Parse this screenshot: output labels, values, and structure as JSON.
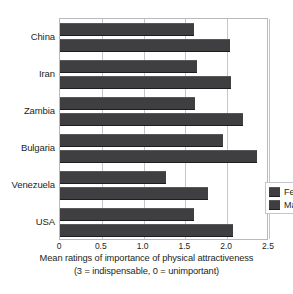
{
  "chart_data": {
    "type": "bar",
    "orientation": "horizontal",
    "title": "",
    "subtitle": "",
    "xlabel": "Mean ratings of importance of physical attractiveness",
    "xlabel_line2": "(3 = indispensable, 0 = unimportant)",
    "ylabel": "",
    "categories": [
      "China",
      "Iran",
      "Zambia",
      "Bulgaria",
      "Venezuela",
      "USA"
    ],
    "series": [
      {
        "name": "Females",
        "values": [
          1.6,
          1.64,
          1.61,
          1.95,
          1.27,
          1.6
        ]
      },
      {
        "name": "Males",
        "values": [
          2.03,
          2.05,
          2.19,
          2.36,
          1.77,
          2.07
        ]
      }
    ],
    "xlim": [
      0,
      2.5
    ],
    "xticks": [
      0,
      0.5,
      1.0,
      1.5,
      2.0,
      2.5
    ],
    "xtick_labels": [
      "0",
      "0.5",
      "1.0",
      "1.5",
      "2.0",
      "2.5"
    ],
    "grid": true,
    "grid_axis": "x",
    "legend_position": "center-right",
    "colors": {
      "females_bar": "#3f3f41",
      "males_bar": "#3f3f41",
      "grid": "#c6c6c8",
      "frame": "#b9b9bb",
      "text": "#231f20",
      "background": "#ffffff"
    }
  },
  "legend": {
    "entries": [
      {
        "label": "Females"
      },
      {
        "label": "Males"
      }
    ]
  }
}
